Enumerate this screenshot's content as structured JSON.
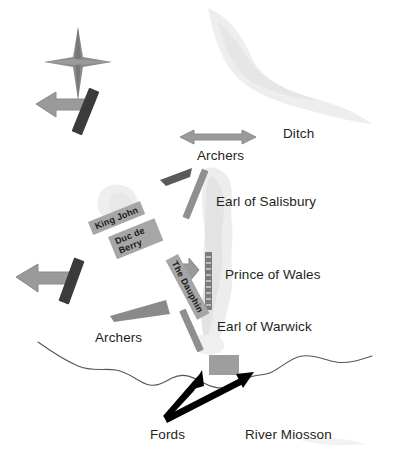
{
  "map": {
    "title": "Battle of Poitiers tactical map",
    "width": 413,
    "height": 475,
    "background": "#ffffff"
  },
  "colors": {
    "dark_unit": "#3f3f3f",
    "mid_unit": "#808080",
    "light_unit": "#a6a6a6",
    "arrow_gray": "#9a9a9a",
    "arrow_black": "#000000",
    "terrain": "#ebebeb",
    "river": "#55504c",
    "text": "#231f20"
  },
  "labels": [
    {
      "id": "ditch",
      "text": "Ditch",
      "x": 283,
      "y": 126,
      "size": 14
    },
    {
      "id": "archers-north",
      "text": "Archers",
      "x": 197,
      "y": 148,
      "size": 14
    },
    {
      "id": "earl-of-salisbury",
      "text": "Earl of Salisbury",
      "x": 216,
      "y": 194,
      "size": 14
    },
    {
      "id": "prince-of-wales",
      "text": "Prince of Wales",
      "x": 225,
      "y": 267,
      "size": 14
    },
    {
      "id": "earl-of-warwick",
      "text": "Earl of Warwick",
      "x": 217,
      "y": 319,
      "size": 14
    },
    {
      "id": "archers-south",
      "text": "Archers",
      "x": 95,
      "y": 330,
      "size": 14
    },
    {
      "id": "fords",
      "text": "Fords",
      "x": 150,
      "y": 427,
      "size": 14
    },
    {
      "id": "river-miosson",
      "text": "River Miosson",
      "x": 245,
      "y": 427,
      "size": 14
    }
  ],
  "unit_labels": [
    {
      "id": "king-john",
      "text": "King John",
      "x": 88,
      "y": 222,
      "rotate": -22,
      "wrap": false
    },
    {
      "id": "duc-de-berry",
      "text": "Duc de Berry",
      "x": 108,
      "y": 237,
      "rotate": -22,
      "wrap": true
    },
    {
      "id": "the-dauphin",
      "text": "The Dauphin",
      "x": 178,
      "y": 254,
      "rotate": 62,
      "wrap": false
    }
  ],
  "compass": {
    "id": "compass-star",
    "x": 78,
    "y": 62,
    "arm_long": 33,
    "arm_short": 16,
    "color": "#8d8d8d"
  },
  "legend_text": {
    "french_units": [
      "King John",
      "Duc de Berry",
      "The Dauphin"
    ],
    "english_units": [
      "Earl of Salisbury",
      "Prince of Wales",
      "Earl of Warwick"
    ],
    "terrain_features": [
      "Ditch",
      "Fords",
      "River Miosson"
    ],
    "troop_types": [
      "Archers"
    ]
  }
}
